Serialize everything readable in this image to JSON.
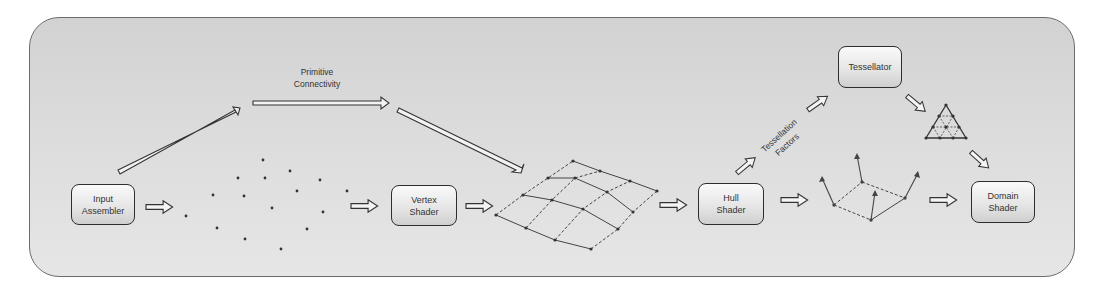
{
  "diagram": {
    "type": "pipeline-flow",
    "stages": [
      {
        "id": "input-assembler",
        "lines": [
          "Input",
          "Assembler"
        ]
      },
      {
        "id": "vertex-shader",
        "lines": [
          "Vertex",
          "Shader"
        ]
      },
      {
        "id": "hull-shader",
        "lines": [
          "Hull",
          "Shader"
        ]
      },
      {
        "id": "tessellator",
        "lines": [
          "Tessellator"
        ]
      },
      {
        "id": "domain-shader",
        "lines": [
          "Domain",
          "Shader"
        ]
      }
    ],
    "edge_labels": {
      "primitive_connectivity": [
        "Primitive",
        "Connectivity"
      ],
      "tessellation_factors": [
        "Tessellation",
        "Factors"
      ]
    },
    "intermediate_visuals": [
      {
        "id": "vertex-point-cloud",
        "description": "scattered vertex points"
      },
      {
        "id": "control-mesh",
        "description": "4x3 quad patch mesh"
      },
      {
        "id": "patch-with-normals",
        "description": "quad patch with normal vectors"
      },
      {
        "id": "tessellated-triangle",
        "description": "subdivided triangle"
      }
    ],
    "edges": [
      [
        "input-assembler",
        "vertex-point-cloud"
      ],
      [
        "vertex-point-cloud",
        "vertex-shader"
      ],
      [
        "vertex-shader",
        "control-mesh"
      ],
      [
        "input-assembler",
        "control-mesh",
        "Primitive Connectivity"
      ],
      [
        "control-mesh",
        "hull-shader"
      ],
      [
        "hull-shader",
        "tessellator",
        "Tessellation Factors"
      ],
      [
        "hull-shader",
        "patch-with-normals"
      ],
      [
        "tessellator",
        "tessellated-triangle"
      ],
      [
        "tessellated-triangle",
        "domain-shader"
      ],
      [
        "patch-with-normals",
        "domain-shader"
      ]
    ]
  }
}
